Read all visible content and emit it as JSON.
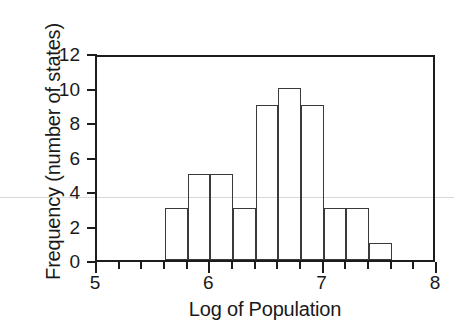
{
  "chart_data": {
    "type": "bar",
    "title": "",
    "subtitle": "",
    "xlabel": "Log of Population",
    "ylabel": "Frequency (number of states)",
    "xlim": [
      5,
      8
    ],
    "ylim": [
      0,
      12
    ],
    "grid": false,
    "legend": null,
    "bin_width": 0.2,
    "x_tick_labels": [
      "5",
      "6",
      "7",
      "8"
    ],
    "x_tick_values": [
      5,
      6,
      7,
      8
    ],
    "x_minor_tick_values": [
      5.2,
      5.4,
      5.6,
      5.8,
      6.2,
      6.4,
      6.6,
      6.8,
      7.2,
      7.4,
      7.6,
      7.8
    ],
    "y_tick_labels": [
      "0",
      "2",
      "4",
      "6",
      "8",
      "10",
      "12"
    ],
    "y_tick_values": [
      0,
      2,
      4,
      6,
      8,
      10,
      12
    ],
    "bins": [
      {
        "start": 5.6,
        "end": 5.8,
        "value": 3
      },
      {
        "start": 5.8,
        "end": 6.0,
        "value": 5
      },
      {
        "start": 6.0,
        "end": 6.2,
        "value": 5
      },
      {
        "start": 6.2,
        "end": 6.4,
        "value": 3
      },
      {
        "start": 6.4,
        "end": 6.6,
        "value": 9
      },
      {
        "start": 6.6,
        "end": 6.8,
        "value": 10
      },
      {
        "start": 6.8,
        "end": 7.0,
        "value": 9
      },
      {
        "start": 7.0,
        "end": 7.2,
        "value": 3
      },
      {
        "start": 7.2,
        "end": 7.4,
        "value": 3
      },
      {
        "start": 7.4,
        "end": 7.6,
        "value": 1
      }
    ],
    "categories": [
      "5.6-5.8",
      "5.8-6.0",
      "6.0-6.2",
      "6.2-6.4",
      "6.4-6.6",
      "6.6-6.8",
      "6.8-7.0",
      "7.0-7.2",
      "7.2-7.4",
      "7.4-7.6"
    ],
    "values": [
      3,
      5,
      5,
      3,
      9,
      10,
      9,
      3,
      3,
      1
    ],
    "colors": {
      "bar_fill": "transparent",
      "bar_stroke": "#3a3a3a",
      "axis": "#1c1c1c",
      "text": "#1a1a1a",
      "background": "#ffffff"
    }
  }
}
